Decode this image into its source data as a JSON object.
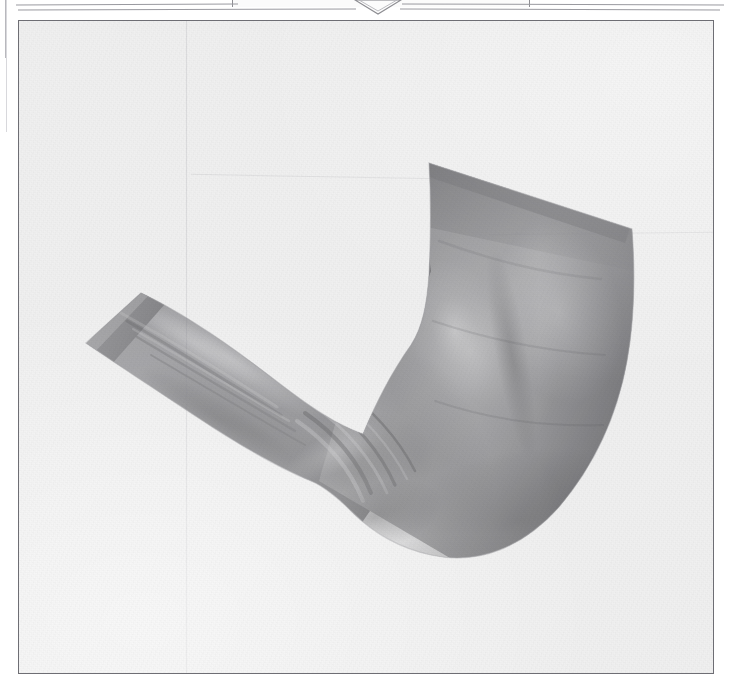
{
  "page": {
    "width": 731,
    "height": 689,
    "background_color": "#ffffff",
    "paper_color": "#f1f1f1",
    "frame_border_color": "#6e6e74"
  },
  "top_marker": {
    "icon": "triangle-down-icon",
    "shape": "downward-pointing-triangle-outline",
    "stroke_color": "#8d8d92",
    "fill_color": "#fcfcfc",
    "center_x": 378,
    "width": 48,
    "height": 15
  },
  "top_bracket": {
    "icon": "page-bracket-icon",
    "stroke_color": "#8d8d92",
    "left": 232,
    "width": 296
  },
  "rules": [
    {
      "name": "top-rule-left",
      "left": 16,
      "top": 4,
      "width": 222,
      "color": "#9a9aa0"
    },
    {
      "name": "top-rule-left-2",
      "left": 18,
      "top": 9,
      "width": 338,
      "color": "#9a9aa0"
    },
    {
      "name": "top-rule-right",
      "left": 402,
      "top": 4,
      "width": 322,
      "color": "#9a9aa0"
    },
    {
      "name": "top-rule-right-2",
      "left": 400,
      "top": 9,
      "width": 320,
      "color": "#9a9aa0"
    }
  ],
  "spine": {
    "name": "page-spine-line",
    "color": "#b8b8bd",
    "left": 5
  },
  "figure": {
    "render_style": "smooth-shaded-grayscale",
    "shadow_color": "#575759",
    "midtone_color": "#8c8c8e",
    "highlight_color": "#b9b9bb",
    "deep_shadow_color": "#4a4a4c",
    "background_color": "#f0f0f0"
  },
  "artifacts": {
    "vertical_streak_x": 167,
    "diagonal_crease_top": 155,
    "diagonal_crease_right_top": 212,
    "grain": "scanned-paper-noise"
  }
}
